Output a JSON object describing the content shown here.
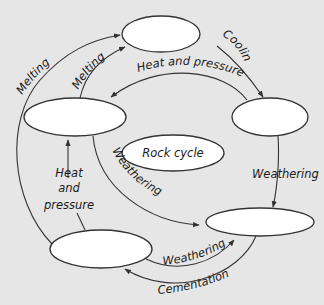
{
  "diagram": {
    "title": "Rock cycle",
    "colors": {
      "background": "#e6e6e6",
      "node_fill": "#ffffff",
      "stroke": "#333333",
      "text": "#1a1a1a"
    },
    "nodes": [
      {
        "id": "top",
        "label": ""
      },
      {
        "id": "left-upper",
        "label": ""
      },
      {
        "id": "right",
        "label": ""
      },
      {
        "id": "center",
        "label": "Rock cycle"
      },
      {
        "id": "bottom-left",
        "label": ""
      },
      {
        "id": "bottom-right",
        "label": ""
      }
    ],
    "edges": {
      "melting_outer": "Melting",
      "melting_inner": "Melting",
      "cooling": "Cooling",
      "heat_and_pressure_top": "Heat and pressure",
      "weathering_right": "Weathering",
      "weathering_left": "Weathering",
      "heat_and_pressure_left_1": "Heat",
      "heat_and_pressure_left_2": "and",
      "heat_and_pressure_left_3": "pressure",
      "weathering_bottom": "Weathering",
      "cementation": "Cementation"
    }
  }
}
